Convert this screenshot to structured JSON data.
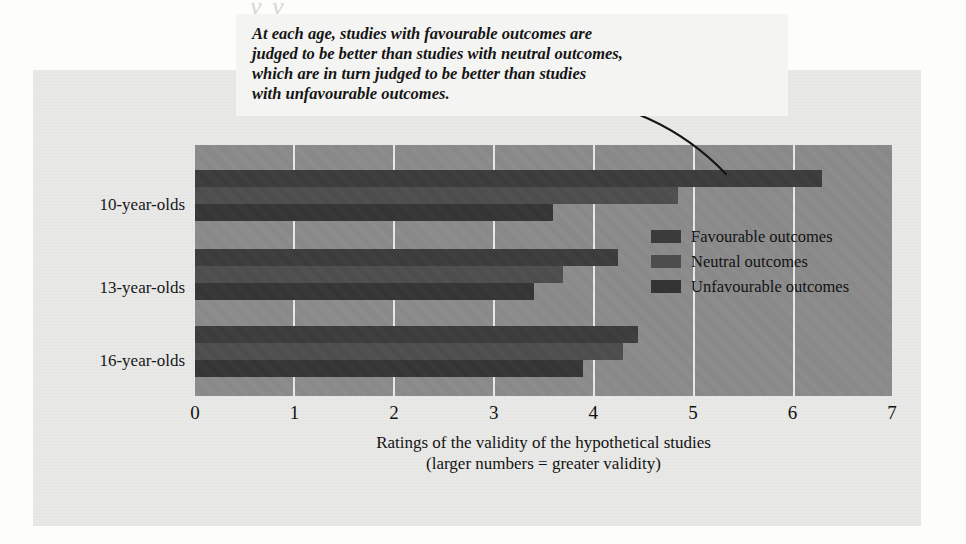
{
  "page": {
    "bleed_text": "y y"
  },
  "annotation": {
    "text": "At each age, studies with favourable outcomes are\njudged to be better than studies with neutral outcomes,\nwhich are in turn judged to be better than studies\nwith unfavourable outcomes."
  },
  "legend": {
    "items": [
      {
        "label": "Favourable outcomes",
        "color": "#3b3b3b"
      },
      {
        "label": "Neutral outcomes",
        "color": "#4d4d4d"
      },
      {
        "label": "Unfavourable outcomes",
        "color": "#343434"
      }
    ]
  },
  "axis": {
    "title_line1": "Ratings of the validity of the hypothetical studies",
    "title_line2": "(larger numbers = greater validity)",
    "ticks": [
      "0",
      "1",
      "2",
      "3",
      "4",
      "5",
      "6",
      "7"
    ]
  },
  "categories": [
    "10-year-olds",
    "13-year-olds",
    "16-year-olds"
  ],
  "chart_data": {
    "type": "bar",
    "orientation": "horizontal",
    "title": "",
    "xlabel": "Ratings of the validity of the hypothetical studies (larger numbers = greater validity)",
    "ylabel": "",
    "xlim": [
      0,
      7
    ],
    "xticks": [
      0,
      1,
      2,
      3,
      4,
      5,
      6,
      7
    ],
    "grid": true,
    "legend_position": "inside-right",
    "categories": [
      "10-year-olds",
      "13-year-olds",
      "16-year-olds"
    ],
    "series": [
      {
        "name": "Favourable outcomes",
        "color": "#3b3b3b",
        "values": [
          6.3,
          4.25,
          4.45
        ]
      },
      {
        "name": "Neutral outcomes",
        "color": "#4d4d4d",
        "values": [
          4.85,
          3.7,
          4.3
        ]
      },
      {
        "name": "Unfavourable outcomes",
        "color": "#343434",
        "values": [
          3.6,
          3.4,
          3.9
        ]
      }
    ],
    "annotation": "At each age, studies with favourable outcomes are judged to be better than studies with neutral outcomes, which are in turn judged to be better than studies with unfavourable outcomes."
  }
}
